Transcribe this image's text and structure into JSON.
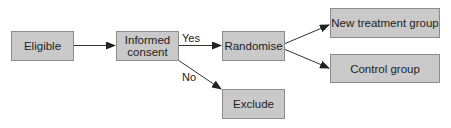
{
  "diagram": {
    "type": "flowchart",
    "nodes": {
      "eligible": {
        "label": "Eligible"
      },
      "informed_consent": {
        "label": "Informed consent",
        "line1": "Informed",
        "line2": "consent"
      },
      "randomise": {
        "label": "Randomise"
      },
      "exclude": {
        "label": "Exclude"
      },
      "new_treatment_group": {
        "label": "New treatment group"
      },
      "control_group": {
        "label": "Control group"
      }
    },
    "edges": [
      {
        "from": "eligible",
        "to": "informed_consent",
        "label": ""
      },
      {
        "from": "informed_consent",
        "to": "randomise",
        "label": "Yes"
      },
      {
        "from": "informed_consent",
        "to": "exclude",
        "label": "No"
      },
      {
        "from": "randomise",
        "to": "new_treatment_group",
        "label": ""
      },
      {
        "from": "randomise",
        "to": "control_group",
        "label": ""
      }
    ],
    "edge_labels": {
      "yes": "Yes",
      "no": "No"
    },
    "colors": {
      "box_fill": "#c9c9c9",
      "box_border": "#8c8c8c",
      "line": "#333333",
      "text": "#222222"
    }
  }
}
